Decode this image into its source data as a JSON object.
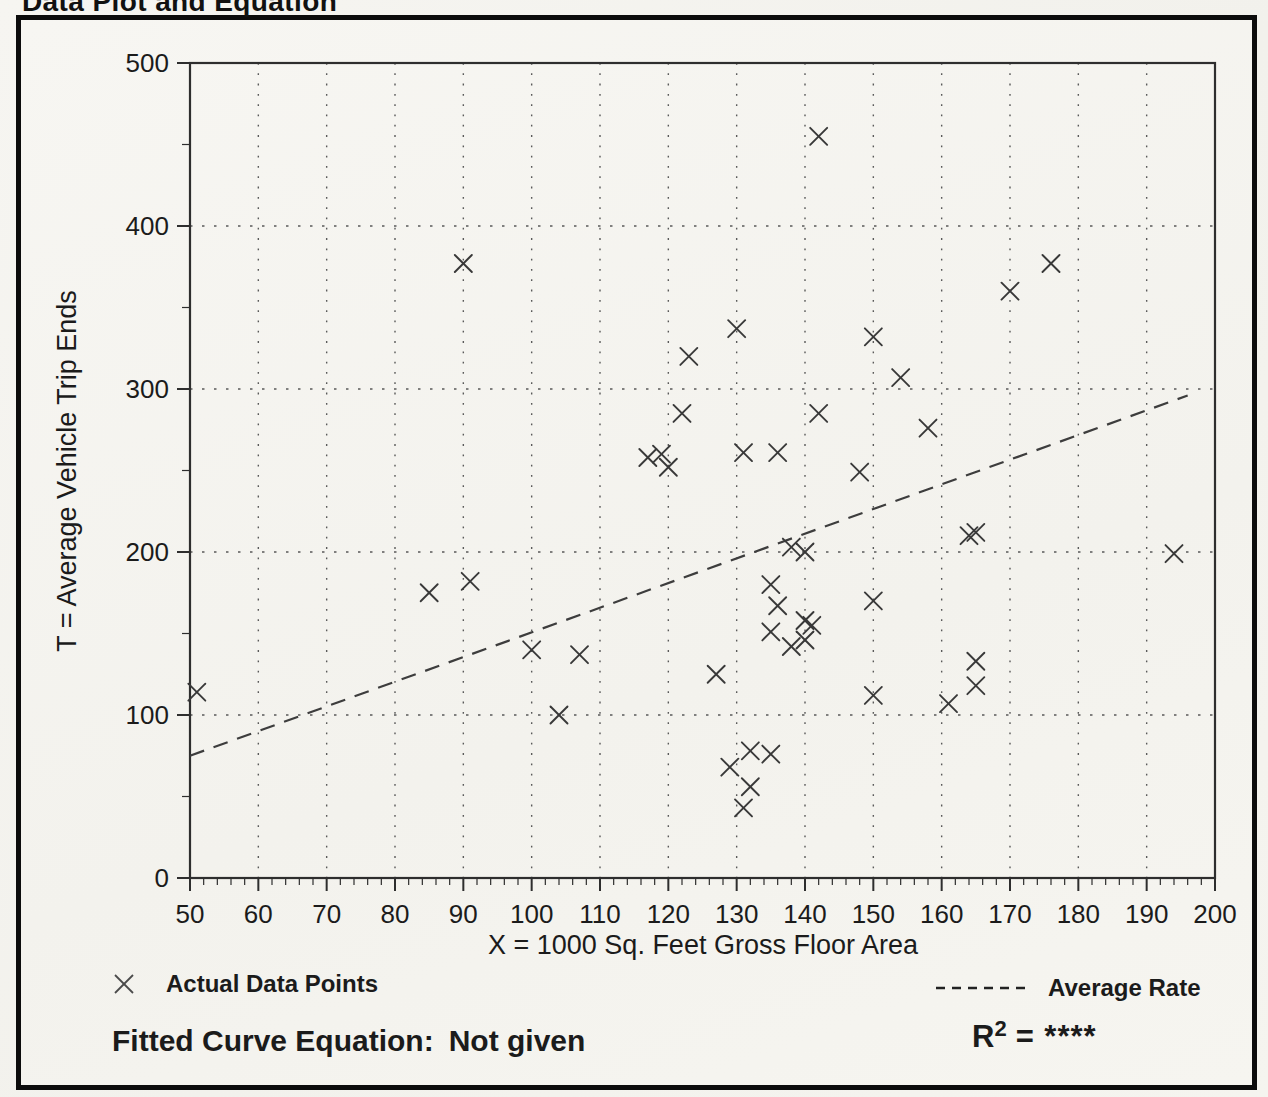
{
  "title": "Data Plot and Equation",
  "colors": {
    "ink": "#1b1b1b",
    "frame_border": "#0c0c0c",
    "plot_border": "#2e2e2e",
    "grid": "#5a5a5a",
    "marker": "#383838",
    "rate_line": "#3d3d3d",
    "paper": "#f5f4f0"
  },
  "chart_data": {
    "type": "scatter",
    "title": "Data Plot and Equation",
    "xlabel": "X = 1000 Sq. Feet Gross Floor Area",
    "ylabel": "T = Average Vehicle Trip Ends",
    "xlim": [
      50,
      200
    ],
    "ylim": [
      0,
      500
    ],
    "xticks": [
      50,
      60,
      70,
      80,
      90,
      100,
      110,
      120,
      130,
      140,
      150,
      160,
      170,
      180,
      190,
      200
    ],
    "yticks": [
      0,
      100,
      200,
      300,
      400,
      500
    ],
    "x_minor_step": 2,
    "y_minor_step": 50,
    "grid": "dotted",
    "legend_position": "bottom",
    "series": [
      {
        "name": "Actual Data Points",
        "marker": "x",
        "points": [
          [
            51,
            114
          ],
          [
            85,
            175
          ],
          [
            90,
            377
          ],
          [
            91,
            182
          ],
          [
            100,
            140
          ],
          [
            104,
            100
          ],
          [
            107,
            137
          ],
          [
            117,
            258
          ],
          [
            119,
            260
          ],
          [
            120,
            252
          ],
          [
            122,
            285
          ],
          [
            123,
            320
          ],
          [
            127,
            125
          ],
          [
            129,
            68
          ],
          [
            130,
            337
          ],
          [
            131,
            261
          ],
          [
            131,
            43
          ],
          [
            132,
            78
          ],
          [
            132,
            56
          ],
          [
            135,
            76
          ],
          [
            135,
            151
          ],
          [
            135,
            180
          ],
          [
            136,
            167
          ],
          [
            136,
            261
          ],
          [
            138,
            142
          ],
          [
            138,
            203
          ],
          [
            140,
            146
          ],
          [
            140,
            158
          ],
          [
            140,
            200
          ],
          [
            141,
            155
          ],
          [
            142,
            285
          ],
          [
            142,
            455
          ],
          [
            148,
            249
          ],
          [
            150,
            112
          ],
          [
            150,
            170
          ],
          [
            150,
            332
          ],
          [
            154,
            307
          ],
          [
            158,
            276
          ],
          [
            161,
            107
          ],
          [
            164,
            210
          ],
          [
            165,
            212
          ],
          [
            165,
            133
          ],
          [
            165,
            118
          ],
          [
            170,
            360
          ],
          [
            176,
            377
          ],
          [
            194,
            199
          ]
        ]
      },
      {
        "name": "Average Rate",
        "style": "dashed-line",
        "line": [
          [
            50,
            75
          ],
          [
            196,
            296
          ]
        ]
      }
    ]
  },
  "legend": {
    "data_points_marker": "x-marker",
    "data_points_label": "Actual Data Points",
    "average_rate_label": "Average Rate"
  },
  "footer": {
    "fitted_curve_label": "Fitted Curve Equation:",
    "fitted_curve_value": "Not given",
    "r2_base": "R",
    "r2_sup": "2",
    "r2_value": "= ****"
  }
}
